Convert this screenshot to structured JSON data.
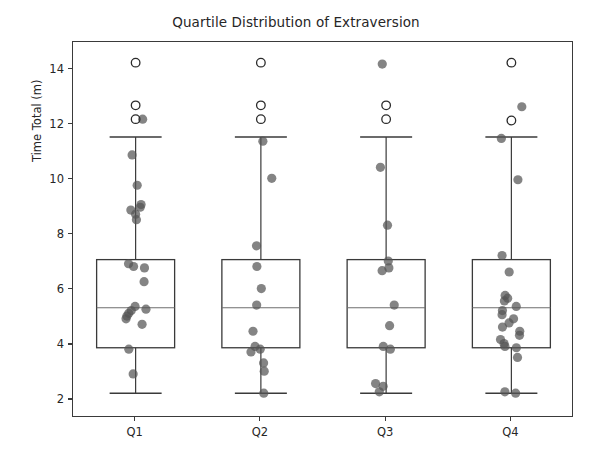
{
  "chart_data": {
    "type": "box",
    "title": "Quartile Distribution of Extraversion",
    "xlabel": "",
    "ylabel": "Time Total (m)",
    "categories": [
      "Q1",
      "Q2",
      "Q3",
      "Q4"
    ],
    "ylim": [
      1.35,
      15.0
    ],
    "yticks": [
      2,
      4,
      6,
      8,
      10,
      12,
      14
    ],
    "ytick_labels": [
      "2",
      "4",
      "6",
      "8",
      "10",
      "12",
      "14"
    ],
    "grid": false,
    "legend": "none",
    "box_color": "#3a3a3a",
    "median_color": "#6e6e6e",
    "point_color": "#555555",
    "outlier_edge_color": "#2b2b2b",
    "boxes": [
      {
        "category": "Q1",
        "q1": 3.9,
        "median": 5.35,
        "q3": 7.1,
        "whisker_low": 2.25,
        "whisker_high": 11.55,
        "outliers": [
          14.25,
          12.7,
          12.2
        ],
        "points": [
          12.2,
          10.9,
          9.8,
          9.1,
          9.0,
          8.9,
          8.75,
          8.55,
          6.95,
          6.85,
          6.8,
          6.3,
          5.4,
          5.3,
          5.25,
          5.15,
          5.05,
          4.95,
          4.75,
          3.85,
          2.95
        ]
      },
      {
        "category": "Q2",
        "q1": 3.9,
        "median": 5.35,
        "q3": 7.1,
        "whisker_low": 2.25,
        "whisker_high": 11.55,
        "outliers": [
          14.25,
          12.7,
          12.2
        ],
        "points": [
          11.4,
          10.05,
          7.6,
          6.85,
          6.05,
          5.45,
          4.5,
          3.95,
          3.85,
          3.75,
          3.35,
          3.05,
          2.25
        ]
      },
      {
        "category": "Q3",
        "q1": 3.9,
        "median": 5.35,
        "q3": 7.1,
        "whisker_low": 2.25,
        "whisker_high": 11.55,
        "outliers": [
          12.7,
          12.2
        ],
        "points": [
          14.2,
          10.45,
          8.35,
          7.05,
          6.8,
          6.7,
          5.45,
          4.7,
          3.95,
          3.85,
          2.6,
          2.5,
          2.3
        ]
      },
      {
        "category": "Q4",
        "q1": 3.9,
        "median": 5.35,
        "q3": 7.1,
        "whisker_low": 2.25,
        "whisker_high": 11.55,
        "outliers": [
          14.25,
          12.15
        ],
        "points": [
          12.65,
          11.5,
          10.0,
          7.25,
          6.65,
          5.8,
          5.7,
          5.6,
          5.4,
          5.25,
          5.1,
          4.95,
          4.8,
          4.65,
          4.5,
          4.35,
          4.2,
          4.05,
          3.95,
          3.9,
          3.55,
          2.3,
          2.25
        ]
      }
    ]
  },
  "axes": {
    "y_label": "Time Total (m)",
    "y_ticks": [
      "14",
      "12",
      "10",
      "8",
      "6",
      "4",
      "2"
    ],
    "x_ticks": [
      "Q1",
      "Q2",
      "Q3",
      "Q4"
    ]
  }
}
